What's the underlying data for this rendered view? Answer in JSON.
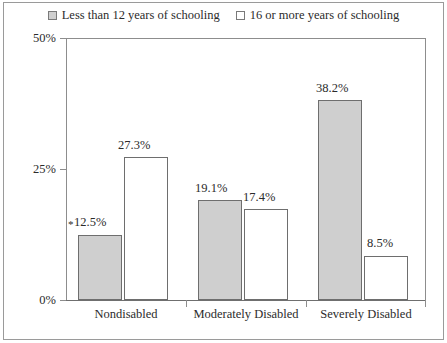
{
  "chart_data": {
    "type": "bar",
    "title": "",
    "subtitle": "",
    "xlabel": "",
    "ylabel": "",
    "ylim": [
      0,
      50
    ],
    "yticks": [
      "0%",
      "25%",
      "50%"
    ],
    "ytick_values": [
      0,
      25,
      50
    ],
    "grid": false,
    "legend_position": "top-center",
    "categories": [
      "Nondisabled",
      "Moderately Disabled",
      "Severely Disabled"
    ],
    "series": [
      {
        "name": "Less than 12 years of schooling",
        "style": "filled",
        "color": "#cfcfcf",
        "values": [
          12.5,
          19.1,
          38.2
        ],
        "labels": [
          "12.5%",
          "19.1%",
          "38.2%"
        ]
      },
      {
        "name": "16 or more years of schooling",
        "style": "open",
        "color": "#ffffff",
        "values": [
          27.3,
          17.4,
          8.5
        ],
        "labels": [
          "27.3%",
          "17.4%",
          "8.5%"
        ]
      }
    ],
    "annotations": [
      {
        "text": "*",
        "series": "Less than 12 years of schooling",
        "category": "Nondisabled"
      }
    ]
  },
  "legend": {
    "items": [
      {
        "label": "Less than 12 years of schooling",
        "swatch": "filled-square-icon"
      },
      {
        "label": "16 or more years of schooling",
        "swatch": "open-square-icon"
      }
    ]
  },
  "axes": {
    "y": {
      "ticks": [
        "0%",
        "25%",
        "50%"
      ]
    },
    "x": {
      "ticks": [
        "Nondisabled",
        "Moderately Disabled",
        "Severely Disabled"
      ]
    }
  }
}
